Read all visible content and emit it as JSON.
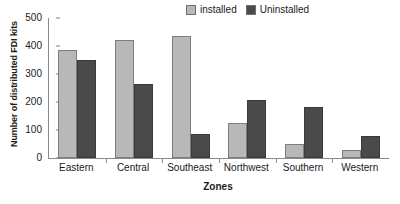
{
  "chart_data": {
    "type": "bar",
    "title": "",
    "xlabel": "Zones",
    "ylabel": "Number of distributed FDI kits",
    "categories": [
      "Eastern",
      "Central",
      "Southeast",
      "Northwest",
      "Southern",
      "Western"
    ],
    "series": [
      {
        "name": "installed",
        "color": "#b8b8b8",
        "values": [
          385,
          420,
          437,
          125,
          50,
          28
        ]
      },
      {
        "name": "Uninstalled",
        "color": "#4a4a4a",
        "values": [
          350,
          265,
          85,
          207,
          183,
          78
        ]
      }
    ],
    "ylim": [
      0,
      500
    ],
    "ytick_labels": [
      "500",
      "400",
      "300",
      "200",
      "100",
      "0"
    ],
    "ytick_values": [
      500,
      400,
      300,
      200,
      100,
      0
    ],
    "grid": false,
    "legend_position": "top-right-inside",
    "legend": [
      {
        "label": "installed",
        "color": "#b8b8b8"
      },
      {
        "label": "Uninstalled",
        "color": "#4a4a4a"
      }
    ]
  }
}
